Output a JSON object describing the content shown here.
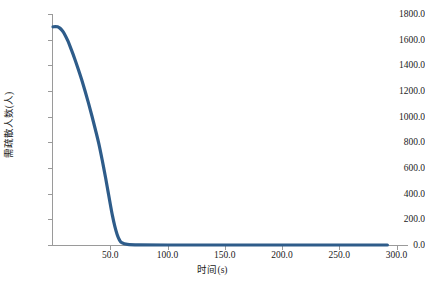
{
  "chart_data": {
    "type": "line",
    "title": "",
    "subtitle": "",
    "xlabel": "时间(s)",
    "ylabel": "需疏散人数(人)",
    "xlim": [
      0,
      310
    ],
    "ylim": [
      0,
      1800
    ],
    "grid": false,
    "legend": null,
    "line_color": "#2e5c8a",
    "line_width": 3.2,
    "x_ticks": [
      50.0,
      100.0,
      150.0,
      200.0,
      250.0,
      300.0
    ],
    "x_tick_labels": [
      "50.0",
      "100.0",
      "150.0",
      "200.0",
      "250.0",
      "300.0"
    ],
    "y_ticks": [
      0.0,
      200.0,
      400.0,
      600.0,
      800.0,
      1000.0,
      1200.0,
      1400.0,
      1600.0,
      1800.0
    ],
    "y_tick_labels": [
      "0.0",
      "200.0",
      "400.0",
      "600.0",
      "800.0",
      "1000.0",
      "1200.0",
      "1400.0",
      "1600.0",
      "1800.0"
    ],
    "series": [
      {
        "name": "需疏散人数",
        "x": [
          0,
          2,
          4,
          6,
          8,
          10,
          13,
          16,
          19,
          22,
          25,
          28,
          31,
          34,
          37,
          40,
          43,
          46,
          48,
          50,
          52,
          54,
          56,
          58,
          60,
          65,
          75,
          100,
          150,
          200,
          250,
          292
        ],
        "y": [
          1700,
          1702,
          1700,
          1690,
          1672,
          1645,
          1590,
          1522,
          1450,
          1372,
          1290,
          1200,
          1105,
          1005,
          900,
          790,
          660,
          520,
          420,
          320,
          225,
          145,
          82,
          40,
          18,
          5,
          1,
          0,
          0,
          0,
          0,
          0
        ]
      }
    ]
  },
  "axes": {
    "y_title": "需疏散人数(人)",
    "x_title": "时间(s)"
  }
}
